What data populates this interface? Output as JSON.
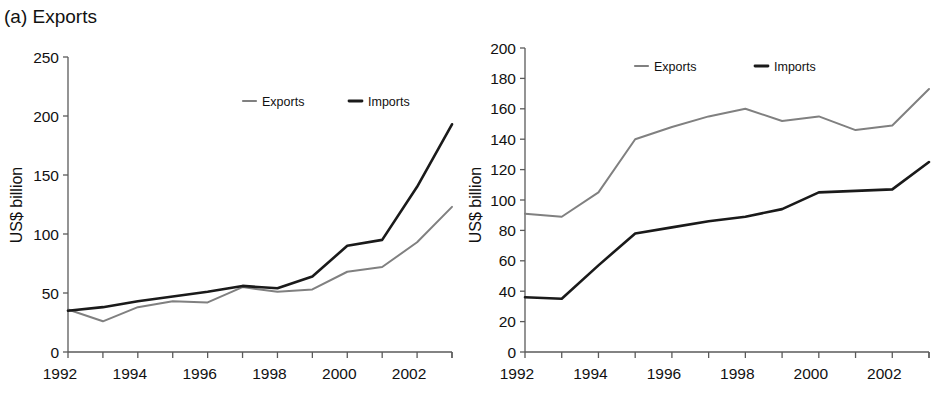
{
  "figure": {
    "panels": [
      {
        "id": "panel-a",
        "label": "(a)",
        "title": "(a)  Exports"
      },
      {
        "id": "panel-b",
        "label": "(b)",
        "title": "(b)  Japan"
      }
    ]
  },
  "colors": {
    "exports_line": "#808080",
    "imports_line": "#1a1a1a",
    "axis": "#5a5a5a",
    "text": "#111111",
    "background": "#ffffff"
  },
  "chart_data": [
    {
      "type": "line",
      "title": "(a)  Exports",
      "xlabel": "",
      "ylabel": "US$ billion",
      "x": [
        1992,
        1993,
        1994,
        1995,
        1996,
        1997,
        1998,
        1999,
        2000,
        2001,
        2002,
        2003
      ],
      "xtick_labels": [
        "1992",
        "1994",
        "1996",
        "1998",
        "2000",
        "2002"
      ],
      "xtick_values": [
        1992,
        1994,
        1996,
        1998,
        2000,
        2002
      ],
      "ytick_labels": [
        "0",
        "50",
        "100",
        "150",
        "200",
        "250"
      ],
      "ytick_values": [
        0,
        50,
        100,
        150,
        200,
        250
      ],
      "ylim": [
        0,
        250
      ],
      "xlim": [
        1992,
        2003
      ],
      "grid": false,
      "legend_position": "top-center",
      "series": [
        {
          "name": "Exports",
          "color": "#808080",
          "width": 2.0,
          "values": [
            36,
            26,
            38,
            43,
            42,
            55,
            51,
            53,
            68,
            72,
            93,
            123
          ]
        },
        {
          "name": "Imports",
          "color": "#1a1a1a",
          "width": 2.6,
          "values": [
            35,
            38,
            43,
            47,
            51,
            56,
            54,
            64,
            90,
            95,
            140,
            193
          ]
        }
      ]
    },
    {
      "type": "line",
      "title": "(b)  Japan",
      "xlabel": "",
      "ylabel": "US$ billion",
      "x": [
        1992,
        1993,
        1994,
        1995,
        1996,
        1997,
        1998,
        1999,
        2000,
        2001,
        2002,
        2003
      ],
      "xtick_labels": [
        "1992",
        "1994",
        "1996",
        "1998",
        "2000",
        "2002"
      ],
      "xtick_values": [
        1992,
        1994,
        1996,
        1998,
        2000,
        2002
      ],
      "ytick_labels": [
        "0",
        "20",
        "40",
        "60",
        "80",
        "100",
        "120",
        "140",
        "160",
        "180",
        "200"
      ],
      "ytick_values": [
        0,
        20,
        40,
        60,
        80,
        100,
        120,
        140,
        160,
        180,
        200
      ],
      "ylim": [
        0,
        200
      ],
      "xlim": [
        1992,
        2003
      ],
      "grid": false,
      "legend_position": "top-center",
      "series": [
        {
          "name": "Exports",
          "color": "#808080",
          "width": 2.0,
          "values": [
            91,
            89,
            105,
            140,
            148,
            155,
            160,
            152,
            155,
            146,
            149,
            173
          ]
        },
        {
          "name": "Imports",
          "color": "#1a1a1a",
          "width": 2.6,
          "values": [
            36,
            35,
            57,
            78,
            82,
            86,
            89,
            94,
            105,
            106,
            107,
            125
          ]
        }
      ]
    }
  ]
}
